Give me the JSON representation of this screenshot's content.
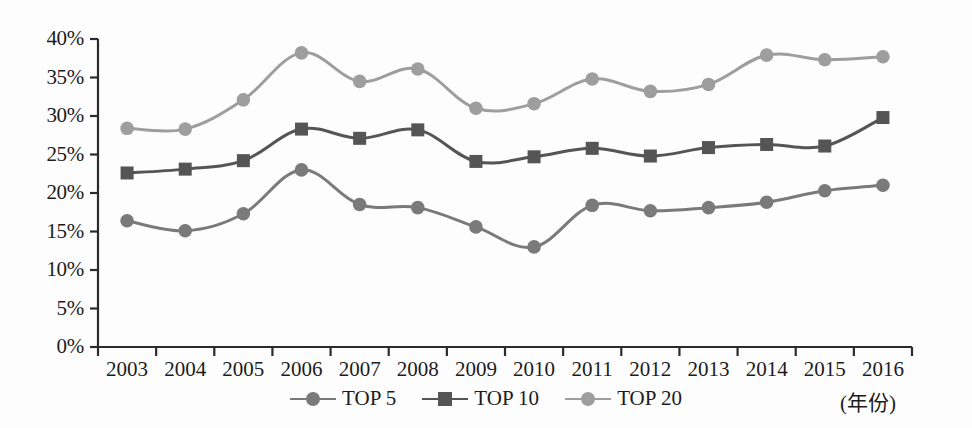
{
  "chart_data": {
    "type": "line",
    "title": "",
    "subtitle": "",
    "xlabel": "(年份)",
    "ylabel": "",
    "categories": [
      "2003",
      "2004",
      "2005",
      "2006",
      "2007",
      "2008",
      "2009",
      "2010",
      "2011",
      "2012",
      "2013",
      "2014",
      "2015",
      "2016"
    ],
    "x": [
      2003,
      2004,
      2005,
      2006,
      2007,
      2008,
      2009,
      2010,
      2011,
      2012,
      2013,
      2014,
      2015,
      2016
    ],
    "ylim": [
      0,
      40
    ],
    "xlim": [
      2003,
      2016
    ],
    "y_tick_labels": [
      "0%",
      "5%",
      "10%",
      "15%",
      "20%",
      "25%",
      "30%",
      "35%",
      "40%"
    ],
    "y_tick_values": [
      0,
      5,
      10,
      15,
      20,
      25,
      30,
      35,
      40
    ],
    "grid": false,
    "legend_position": "bottom-center",
    "series": [
      {
        "name": "TOP 5",
        "marker": "circle",
        "color": "#7a7a7a",
        "values": [
          16.4,
          15.1,
          17.3,
          23.0,
          18.5,
          18.1,
          15.6,
          13.0,
          18.4,
          17.7,
          18.1,
          18.8,
          20.3,
          21.0
        ]
      },
      {
        "name": "TOP 10",
        "marker": "square",
        "color": "#555555",
        "values": [
          22.6,
          23.1,
          24.2,
          28.3,
          27.1,
          28.2,
          24.1,
          24.7,
          25.8,
          24.8,
          25.9,
          26.3,
          26.1,
          29.8
        ]
      },
      {
        "name": "TOP 20",
        "marker": "circle",
        "color": "#9e9e9e",
        "values": [
          28.4,
          28.3,
          32.1,
          38.2,
          34.5,
          36.1,
          31.0,
          31.6,
          34.8,
          33.2,
          34.1,
          37.9,
          37.3,
          37.7
        ]
      }
    ]
  },
  "axis": {
    "unit_label": "(年份)"
  },
  "legend": {
    "items": [
      {
        "label": "TOP 5"
      },
      {
        "label": "TOP 10"
      },
      {
        "label": "TOP 20"
      }
    ]
  },
  "colors": {
    "top5": "#7a7a7a",
    "top10": "#555555",
    "top20": "#9e9e9e",
    "axis": "#2b2b2b",
    "background": "#fdfdfd"
  }
}
